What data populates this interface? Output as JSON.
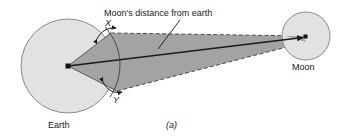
{
  "figure": {
    "caption": "(a)",
    "labels": {
      "distance": "Moon's distance from earth",
      "earth": "Earth",
      "moon": "Moon",
      "angle_x": "X",
      "angle_y": "Y"
    },
    "colors": {
      "background": "#ffffff",
      "body_fill": "#e2e2e2",
      "body_stroke": "#7a7a7a",
      "cone_fill": "#a3a3a3",
      "cone_stroke": "#5f5f5f",
      "line": "#1a1a1a",
      "text": "#1a1a1a"
    },
    "geometry": {
      "earth": {
        "cx": 68,
        "cy": 66,
        "r": 47,
        "center_dot": true
      },
      "moon": {
        "cx": 306,
        "cy": 36,
        "r": 24,
        "center_dot": true
      },
      "cone": {
        "apex": [
          68,
          66
        ],
        "top_tangent": [
          111,
          33
        ],
        "bottom_tangent": [
          117,
          91
        ],
        "far_top": [
          303,
          36
        ],
        "far_bottom": [
          306,
          42
        ]
      },
      "sight_line": {
        "from": [
          68,
          66
        ],
        "to": [
          305,
          37
        ],
        "arrowhead": "end"
      },
      "leader": {
        "from": [
          178,
          21
        ],
        "to": [
          157,
          48
        ]
      },
      "arc": {
        "through": [
          "X",
          "Y"
        ],
        "style": "thin-curve"
      },
      "angle_markers": [
        {
          "name": "X",
          "type": "double-arrow-arc",
          "at": [
            107,
            33
          ]
        },
        {
          "name": "Y",
          "type": "double-arrow-arc",
          "at": [
            114,
            88
          ]
        }
      ]
    }
  }
}
